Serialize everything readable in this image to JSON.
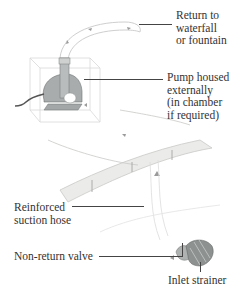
{
  "diagram": {
    "labels": {
      "return": "Return to\nwaterfall\nor fountain",
      "pump": "Pump housed\nexternally\n(in chamber\nif required)",
      "hose": "Reinforced\nsuction hose",
      "valve": "Non-return valve",
      "strainer": "Inlet strainer"
    },
    "colors": {
      "line": "#444444",
      "pump_body": "#9aa0a0",
      "hose_fill": "#e6e6e4",
      "strainer": "#8a8f8c"
    }
  }
}
